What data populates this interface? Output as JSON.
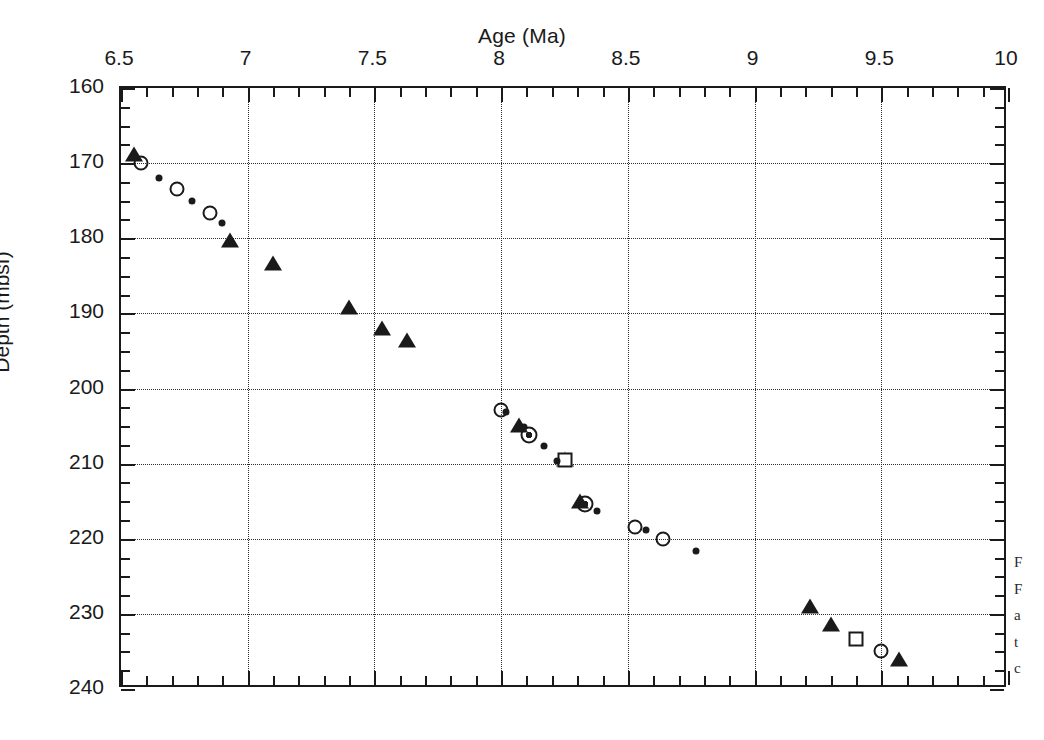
{
  "chart_data": {
    "type": "scatter",
    "title": "Age (Ma)",
    "xlabel": "Age (Ma)",
    "ylabel": "Depth (mbsf)",
    "xlim": [
      6.5,
      10
    ],
    "ylim": [
      160,
      240
    ],
    "y_inverted": true,
    "grid": "dotted major gridlines both axes",
    "legend": "none",
    "x_ticks": [
      "6.5",
      "7",
      "7.5",
      "8",
      "8.5",
      "9",
      "9.5",
      "10"
    ],
    "x_tick_values": [
      6.5,
      7,
      7.5,
      8,
      8.5,
      9,
      9.5,
      10
    ],
    "x_minor_tick_step": 0.1,
    "y_ticks": [
      "160",
      "170",
      "180",
      "190",
      "200",
      "210",
      "220",
      "230",
      "240"
    ],
    "y_tick_values": [
      160,
      170,
      180,
      190,
      200,
      210,
      220,
      230,
      240
    ],
    "y_minor_tick_step": 2.5,
    "series": [
      {
        "name": "filled-triangle",
        "marker": "triangle-filled",
        "points": [
          [
            6.55,
            168.8
          ],
          [
            6.93,
            180.2
          ],
          [
            7.1,
            183.3
          ],
          [
            7.4,
            189.1
          ],
          [
            7.53,
            192.0
          ],
          [
            7.63,
            193.5
          ],
          [
            8.07,
            204.8
          ],
          [
            8.25,
            209.4
          ],
          [
            8.31,
            215.0
          ],
          [
            9.22,
            228.9
          ],
          [
            9.3,
            231.4
          ],
          [
            9.57,
            236.0
          ]
        ]
      },
      {
        "name": "open-circle",
        "marker": "circle-open",
        "points": [
          [
            6.58,
            170.0
          ],
          [
            6.72,
            173.5
          ],
          [
            6.85,
            176.6
          ],
          [
            8.0,
            202.8
          ],
          [
            8.53,
            218.4
          ],
          [
            8.64,
            220.0
          ],
          [
            9.5,
            234.9
          ]
        ]
      },
      {
        "name": "circle-with-center-dot",
        "marker": "circle-dot",
        "points": [
          [
            8.11,
            206.2
          ],
          [
            8.33,
            215.4
          ]
        ]
      },
      {
        "name": "open-square",
        "marker": "square-open",
        "points": [
          [
            8.25,
            209.5
          ],
          [
            9.4,
            233.4
          ]
        ]
      },
      {
        "name": "small-filled-dot",
        "marker": "dot-small",
        "points": [
          [
            6.65,
            172.0
          ],
          [
            6.78,
            175.1
          ],
          [
            6.9,
            178.0
          ],
          [
            8.02,
            203.1
          ],
          [
            8.09,
            205.1
          ],
          [
            8.17,
            207.6
          ],
          [
            8.22,
            209.6
          ],
          [
            8.38,
            216.3
          ],
          [
            8.57,
            218.9
          ],
          [
            8.77,
            221.6
          ]
        ]
      }
    ]
  },
  "caption_fragment": {
    "line1": "F",
    "line2": "F",
    "line3": "a",
    "line4": "t",
    "line5": "c"
  }
}
